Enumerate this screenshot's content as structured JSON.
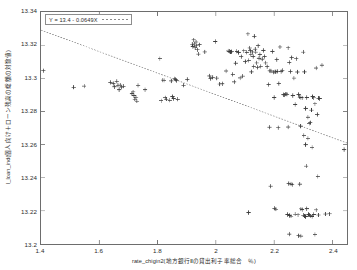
{
  "chart_data": {
    "type": "scatter",
    "title": "",
    "xlabel": "rate_chigin2(地方銀行Ⅱの貸出利子率総合　％)",
    "ylabel": "l_loan_ind(個人向け＋ローン残高の総額の対数値)",
    "xlim": [
      1.4,
      2.45
    ],
    "ylim": [
      13.2,
      13.34
    ],
    "xticks": [
      1.4,
      1.6,
      1.8,
      2,
      2.2,
      2.4
    ],
    "xticklabels": [
      "1.4",
      "1.6",
      "1.8",
      "2",
      "2.2",
      "2.4"
    ],
    "yticks": [
      13.2,
      13.22,
      13.24,
      13.26,
      13.28,
      13.3,
      13.32,
      13.34
    ],
    "yticklabels": [
      "13.2",
      "13.22",
      "13.24",
      "13.26",
      "13.28",
      "13.3",
      "13.32",
      "13.34"
    ],
    "grid": false,
    "marker": "plus",
    "marker_color": "#3a3a3a",
    "frame_color": "#6d6d6d",
    "legend_position": "top-left",
    "legend": [
      {
        "label": "Y = 13.4 - 0.0649X",
        "style": "dotted-line",
        "color": "#8a8a8a"
      }
    ],
    "fit_line": {
      "label": "Y = 13.4 - 0.0649X",
      "intercept": 13.4,
      "slope": -0.0649,
      "style": "dotted",
      "color": "#8a8a8a",
      "x_start": 1.4,
      "x_end": 2.45,
      "y_start": 13.3291,
      "y_end": 13.2609
    },
    "points": [
      [
        1.408,
        13.3046
      ],
      [
        1.512,
        13.2946
      ],
      [
        1.548,
        13.2953
      ],
      [
        1.638,
        13.2975
      ],
      [
        1.648,
        13.2968
      ],
      [
        1.652,
        13.2949
      ],
      [
        1.66,
        13.2982
      ],
      [
        1.664,
        13.2958
      ],
      [
        1.668,
        13.2931
      ],
      [
        1.672,
        13.2959
      ],
      [
        1.676,
        13.2947
      ],
      [
        1.683,
        13.2952
      ],
      [
        1.712,
        13.2907
      ],
      [
        1.716,
        13.2918
      ],
      [
        1.719,
        13.2895
      ],
      [
        1.722,
        13.2874
      ],
      [
        1.726,
        13.2886
      ],
      [
        1.729,
        13.2862
      ],
      [
        1.733,
        13.2957
      ],
      [
        1.757,
        13.2931
      ],
      [
        1.808,
        13.3119
      ],
      [
        1.812,
        13.2865
      ],
      [
        1.818,
        13.2989
      ],
      [
        1.822,
        13.2988
      ],
      [
        1.826,
        13.2883
      ],
      [
        1.83,
        13.2874
      ],
      [
        1.842,
        13.2867
      ],
      [
        1.847,
        13.2984
      ],
      [
        1.851,
        13.2889
      ],
      [
        1.855,
        13.2878
      ],
      [
        1.859,
        13.2997
      ],
      [
        1.862,
        13.2993
      ],
      [
        1.865,
        13.2986
      ],
      [
        1.869,
        13.2873
      ],
      [
        1.889,
        13.2958
      ],
      [
        1.902,
        13.2993
      ],
      [
        1.919,
        13.3206
      ],
      [
        1.921,
        13.3192
      ],
      [
        1.924,
        13.3232
      ],
      [
        1.926,
        13.3207
      ],
      [
        1.929,
        13.3184
      ],
      [
        1.932,
        13.3219
      ],
      [
        1.934,
        13.3196
      ],
      [
        1.937,
        13.3172
      ],
      [
        1.94,
        13.3146
      ],
      [
        1.944,
        13.3203
      ],
      [
        1.962,
        13.3159
      ],
      [
        1.978,
        13.3014
      ],
      [
        1.982,
        13.2998
      ],
      [
        1.989,
        13.3006
      ],
      [
        1.998,
        13.3222
      ],
      [
        2.003,
        13.3001
      ],
      [
        2.013,
        13.2965
      ],
      [
        2.022,
        13.2967
      ],
      [
        2.035,
        13.3044
      ],
      [
        2.042,
        13.3165
      ],
      [
        2.046,
        13.3163
      ],
      [
        2.05,
        13.3158
      ],
      [
        2.054,
        13.3161
      ],
      [
        2.058,
        13.3024
      ],
      [
        2.063,
        13.2978
      ],
      [
        2.068,
        13.3091
      ],
      [
        2.072,
        13.3163
      ],
      [
        2.078,
        13.3156
      ],
      [
        2.083,
        13.3002
      ],
      [
        2.087,
        13.3131
      ],
      [
        2.092,
        13.3013
      ],
      [
        2.096,
        13.3166
      ],
      [
        2.101,
        13.3101
      ],
      [
        2.106,
        13.3157
      ],
      [
        2.11,
        13.3268
      ],
      [
        2.113,
        13.3108
      ],
      [
        2.116,
        13.3183
      ],
      [
        2.118,
        13.3167
      ],
      [
        2.12,
        13.3142
      ],
      [
        2.122,
        13.3039
      ],
      [
        2.125,
        13.3159
      ],
      [
        2.128,
        13.3132
      ],
      [
        2.13,
        13.3071
      ],
      [
        2.132,
        13.3253
      ],
      [
        2.135,
        13.3176
      ],
      [
        2.137,
        13.3158
      ],
      [
        2.14,
        13.3093
      ],
      [
        2.143,
        13.3066
      ],
      [
        2.145,
        13.3197
      ],
      [
        2.148,
        13.3121
      ],
      [
        2.151,
        13.3144
      ],
      [
        2.154,
        13.3072
      ],
      [
        2.112,
        13.219
      ],
      [
        2.159,
        13.3116
      ],
      [
        2.163,
        13.3168
      ],
      [
        2.167,
        13.3132
      ],
      [
        2.171,
        13.3093
      ],
      [
        2.176,
        13.307
      ],
      [
        2.181,
        13.2962
      ],
      [
        2.185,
        13.3045
      ],
      [
        2.189,
        13.3044
      ],
      [
        2.194,
        13.3162
      ],
      [
        2.198,
        13.3037
      ],
      [
        2.2,
        13.2884
      ],
      [
        2.203,
        13.3039
      ],
      [
        2.206,
        13.304
      ],
      [
        2.209,
        13.3113
      ],
      [
        2.212,
        13.3042
      ],
      [
        2.216,
        13.2968
      ],
      [
        2.22,
        13.3189
      ],
      [
        2.224,
        13.3041
      ],
      [
        2.228,
        13.3048
      ],
      [
        2.232,
        13.2901
      ],
      [
        2.236,
        13.2899
      ],
      [
        2.24,
        13.2906
      ],
      [
        2.244,
        13.2903
      ],
      [
        2.248,
        13.3184
      ],
      [
        2.252,
        13.3096
      ],
      [
        2.256,
        13.3041
      ],
      [
        2.26,
        13.3125
      ],
      [
        2.264,
        13.2896
      ],
      [
        2.268,
        13.3001
      ],
      [
        2.272,
        13.2842
      ],
      [
        2.276,
        13.3118
      ],
      [
        2.28,
        13.3038
      ],
      [
        2.284,
        13.2902
      ],
      [
        2.288,
        13.2886
      ],
      [
        2.292,
        13.2884
      ],
      [
        2.296,
        13.2882
      ],
      [
        2.3,
        13.3158
      ],
      [
        2.304,
        13.3039
      ],
      [
        2.308,
        13.2818
      ],
      [
        2.312,
        13.2884
      ],
      [
        2.316,
        13.2765
      ],
      [
        2.32,
        13.2728
      ],
      [
        2.324,
        13.2732
      ],
      [
        2.328,
        13.2808
      ],
      [
        2.332,
        13.2889
      ],
      [
        2.336,
        13.2882
      ],
      [
        2.34,
        13.2846
      ],
      [
        2.344,
        13.3062
      ],
      [
        2.348,
        13.2782
      ],
      [
        2.352,
        13.288
      ],
      [
        2.356,
        13.2878
      ],
      [
        2.364,
        13.3079
      ],
      [
        2.184,
        13.2705
      ],
      [
        2.214,
        13.2702
      ],
      [
        2.248,
        13.2706
      ],
      [
        2.291,
        13.2711
      ],
      [
        2.302,
        13.2655
      ],
      [
        2.308,
        13.26
      ],
      [
        2.316,
        13.2638
      ],
      [
        2.33,
        13.2583
      ],
      [
        2.31,
        13.247
      ],
      [
        2.35,
        13.2408
      ],
      [
        2.44,
        13.257
      ],
      [
        2.188,
        13.2349
      ],
      [
        2.25,
        13.2365
      ],
      [
        2.258,
        13.2362
      ],
      [
        2.262,
        13.2358
      ],
      [
        2.288,
        13.2361
      ],
      [
        2.201,
        13.2215
      ],
      [
        2.206,
        13.221
      ],
      [
        2.246,
        13.2178
      ],
      [
        2.253,
        13.2172
      ],
      [
        2.258,
        13.2168
      ],
      [
        2.272,
        13.218
      ],
      [
        2.282,
        13.2176
      ],
      [
        2.292,
        13.2212
      ],
      [
        2.296,
        13.2208
      ],
      [
        2.3,
        13.2174
      ],
      [
        2.304,
        13.2169
      ],
      [
        2.308,
        13.2166
      ],
      [
        2.312,
        13.2213
      ],
      [
        2.318,
        13.2178
      ],
      [
        2.322,
        13.2174
      ],
      [
        2.326,
        13.217
      ],
      [
        2.33,
        13.2166
      ],
      [
        2.336,
        13.2178
      ],
      [
        2.344,
        13.2206
      ],
      [
        2.352,
        13.2175
      ],
      [
        2.376,
        13.2181
      ],
      [
        2.39,
        13.2182
      ],
      [
        2.252,
        13.206
      ],
      [
        2.284,
        13.205
      ],
      [
        2.292,
        13.2048
      ],
      [
        2.34,
        13.2058
      ]
    ]
  }
}
